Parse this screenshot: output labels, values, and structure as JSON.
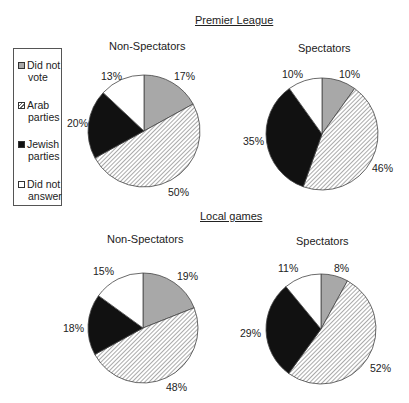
{
  "chart_data": [
    {
      "type": "pie",
      "group": "Premier League",
      "title": "Non-Spectators",
      "categories": [
        "Did not vote",
        "Arab parties",
        "Jewish parties",
        "Did not answer"
      ],
      "values": [
        17,
        50,
        20,
        13
      ],
      "labels": [
        "17%",
        "50%",
        "20%",
        "13%"
      ]
    },
    {
      "type": "pie",
      "group": "Premier League",
      "title": "Spectators",
      "categories": [
        "Did not vote",
        "Arab parties",
        "Jewish parties",
        "Did not answer"
      ],
      "values": [
        10,
        46,
        35,
        10
      ],
      "labels": [
        "10%",
        "46%",
        "35%",
        "10%"
      ]
    },
    {
      "type": "pie",
      "group": "Local games",
      "title": "Non-Spectators",
      "categories": [
        "Did not vote",
        "Arab parties",
        "Jewish parties",
        "Did not answer"
      ],
      "values": [
        19,
        48,
        18,
        15
      ],
      "labels": [
        "19%",
        "48%",
        "18%",
        "15%"
      ]
    },
    {
      "type": "pie",
      "group": "Local games",
      "title": "Spectators",
      "categories": [
        "Did not vote",
        "Arab parties",
        "Jewish parties",
        "Did not answer"
      ],
      "values": [
        8,
        52,
        29,
        11
      ],
      "labels": [
        "8%",
        "52%",
        "29%",
        "11%"
      ]
    }
  ],
  "titles": {
    "premier": "Premier League",
    "local": "Local games"
  },
  "subtitles": {
    "pl_non": "Non-Spectators",
    "pl_spec": "Spectators",
    "lg_non": "Non-Spectators",
    "lg_spec": "Spectators"
  },
  "legend": [
    {
      "line1": "Did not",
      "line2": "vote",
      "fill": "gray"
    },
    {
      "line1": "Arab",
      "line2": "parties",
      "fill": "hatched"
    },
    {
      "line1": "Jewish",
      "line2": "parties",
      "fill": "black"
    },
    {
      "line1": "Did not",
      "line2": "answer",
      "fill": "white"
    }
  ],
  "colors": {
    "did_not_vote": "#a8a8a8",
    "arab_parties_hatch": "#555555",
    "jewish_parties": "#111111",
    "did_not_answer": "#ffffff",
    "outline": "#444444"
  },
  "pct": {
    "pl_non": {
      "dnv": "17%",
      "arab": "50%",
      "jew": "20%",
      "dna": "13%"
    },
    "pl_spec": {
      "dnv": "10%",
      "arab": "46%",
      "jew": "35%",
      "dna": "10%"
    },
    "lg_non": {
      "dnv": "19%",
      "arab": "48%",
      "jew": "18%",
      "dna": "15%"
    },
    "lg_spec": {
      "dnv": "8%",
      "arab": "52%",
      "jew": "29%",
      "dna": "11%"
    }
  }
}
